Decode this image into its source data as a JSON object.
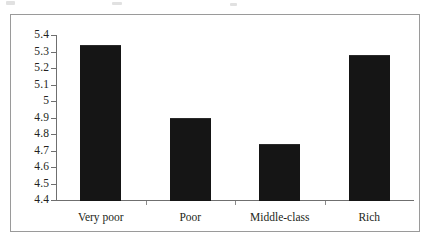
{
  "chart_data": {
    "type": "bar",
    "title": "",
    "subtitle": "",
    "xlabel": "",
    "ylabel": "",
    "categories": [
      "Very poor",
      "Poor",
      "Middle-class",
      "Rich"
    ],
    "values": [
      5.34,
      4.9,
      4.74,
      5.28
    ],
    "ylim": [
      4.4,
      5.4
    ],
    "ytick_labels": [
      "5.4",
      "5.3",
      "5.2",
      "5.1",
      "5",
      "4.9",
      "4.8",
      "4.7",
      "4.6",
      "4.5",
      "4.4"
    ],
    "ytick_values": [
      5.4,
      5.3,
      5.2,
      5.1,
      5.0,
      4.9,
      4.8,
      4.7,
      4.6,
      4.5,
      4.4
    ],
    "grid": false,
    "legend": false,
    "legend_position": "none",
    "bar_color": "#151515",
    "axis_color": "#6f6f6f",
    "frame_color": "#9a9a9a",
    "text_color": "#231f20"
  }
}
